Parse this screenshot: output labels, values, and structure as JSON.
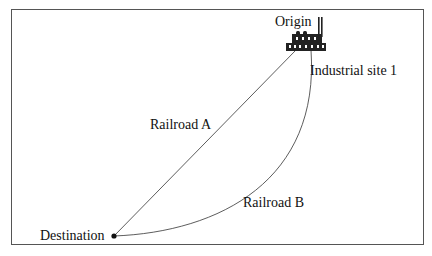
{
  "diagram": {
    "labels": {
      "origin": "Origin",
      "industrial_site": "Industrial site 1",
      "railroad_a": "Railroad A",
      "railroad_b": "Railroad B",
      "destination": "Destination"
    },
    "icons": {
      "origin": "factory-icon",
      "destination": "dot-marker"
    }
  }
}
